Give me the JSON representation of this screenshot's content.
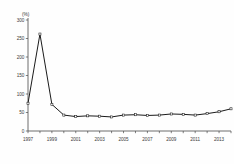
{
  "chart_data": {
    "type": "line",
    "title": "",
    "subtitle": "",
    "xlabel": "",
    "ylabel": "",
    "unit_label": "(%)",
    "grid": false,
    "legend": "none",
    "xlim": [
      1997,
      2014
    ],
    "ylim": [
      0,
      300
    ],
    "ytick_labels": [
      "300",
      "250",
      "200",
      "150",
      "100",
      "50",
      "0"
    ],
    "ytick_values": [
      300,
      250,
      200,
      150,
      100,
      50,
      0
    ],
    "xtick_values": [
      1997,
      1998,
      1999,
      2000,
      2001,
      2002,
      2003,
      2004,
      2005,
      2006,
      2007,
      2008,
      2009,
      2010,
      2011,
      2012,
      2013,
      2014
    ],
    "xtick_labels_shown": [
      "1997",
      "1999",
      "2001",
      "2003",
      "2005",
      "2007",
      "2009",
      "2011",
      "2013"
    ],
    "xtick_label_values": [
      1997,
      1999,
      2001,
      2003,
      2005,
      2007,
      2009,
      2011,
      2013
    ],
    "x": [
      1997,
      1998,
      1999,
      2000,
      2001,
      2002,
      2003,
      2004,
      2005,
      2006,
      2007,
      2008,
      2009,
      2010,
      2011,
      2012,
      2013,
      2014
    ],
    "values": [
      75,
      262,
      72,
      43,
      39,
      41,
      40,
      38,
      43,
      44,
      42,
      43,
      46,
      45,
      43,
      47,
      52,
      60
    ],
    "marker": "open-square",
    "line_color": "#1a1a1a",
    "marker_fill": "#ffffff",
    "axis_color": "#4a4a4a",
    "background_color": "#ffffff"
  }
}
